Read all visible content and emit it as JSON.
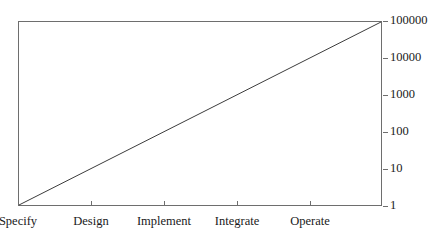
{
  "chart_data": {
    "type": "line",
    "title": "",
    "subtitle": "",
    "xlabel": "",
    "ylabel": "",
    "yscale": "log",
    "ylim": [
      1,
      100000
    ],
    "grid": false,
    "legend": null,
    "categories": [
      "Specify",
      "Design",
      "Implement",
      "Integrate",
      "Operate"
    ],
    "x_tick_labels": [
      "Specify",
      "Design",
      "Implement",
      "Integrate",
      "Operate"
    ],
    "y_tick_labels": [
      "1",
      "10",
      "100",
      "1000",
      "10000",
      "100000"
    ],
    "y_tick_values": [
      1,
      10,
      100,
      1000,
      10000,
      100000
    ],
    "series": [
      {
        "name": "Cost of change",
        "x": [
          "Specify",
          "Design",
          "Implement",
          "Integrate",
          "Operate"
        ],
        "values": [
          1,
          46,
          2154,
          100000,
          4641589
        ],
        "points": [
          {
            "x": 0,
            "y": 1
          },
          {
            "x": 1,
            "y": 46
          },
          {
            "x": 2,
            "y": 2154
          },
          {
            "x": 3,
            "y": 100000
          },
          {
            "x": 4,
            "y": 4641589
          }
        ],
        "line_start": {
          "x_label": "Specify",
          "y": 1
        },
        "line_end": {
          "x_label": "beyond Operate",
          "y": 100000
        },
        "color": "#3c3c3c"
      }
    ],
    "axis_color": "#6e6e6e",
    "background_color": "#ffffff"
  },
  "axes": {
    "y": {
      "position": "right",
      "ticks": [
        {
          "label": "100000",
          "value": 100000,
          "top": 21
        },
        {
          "label": "10000",
          "value": 10000,
          "top": 58
        },
        {
          "label": "1000",
          "value": 1000,
          "top": 95
        },
        {
          "label": "100",
          "value": 100,
          "top": 132
        },
        {
          "label": "10",
          "value": 10,
          "top": 169
        },
        {
          "label": "1",
          "value": 1,
          "top": 206
        }
      ]
    },
    "x": {
      "position": "bottom",
      "ticks": [
        {
          "label": "Specify",
          "left": 18
        },
        {
          "label": "Design",
          "left": 91
        },
        {
          "label": "Implement",
          "left": 164
        },
        {
          "label": "Integrate",
          "left": 237
        },
        {
          "label": "Operate",
          "left": 310
        }
      ]
    }
  }
}
